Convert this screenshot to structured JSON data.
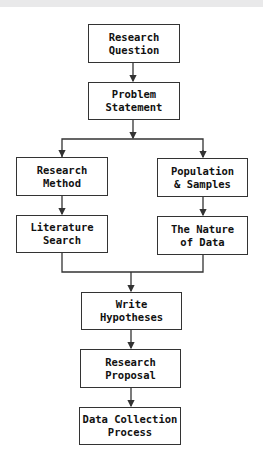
{
  "diagram": {
    "type": "flowchart",
    "nodes": {
      "research_question": {
        "line1": "Research",
        "line2": "Question"
      },
      "problem_statement": {
        "line1": "Problem",
        "line2": "Statement"
      },
      "research_method": {
        "line1": "Research",
        "line2": "Method"
      },
      "literature_search": {
        "line1": "Literature",
        "line2": "Search"
      },
      "population_samples": {
        "line1": "Population",
        "line2": "& Samples"
      },
      "nature_of_data": {
        "line1": "The Nature",
        "line2": "of Data"
      },
      "write_hypotheses": {
        "line1": "Write",
        "line2": "Hypotheses"
      },
      "research_proposal": {
        "line1": "Research",
        "line2": "Proposal"
      },
      "data_collection": {
        "line1": "Data Collection",
        "line2": "Process"
      }
    },
    "edges": [
      [
        "research_question",
        "problem_statement"
      ],
      [
        "problem_statement",
        "research_method"
      ],
      [
        "problem_statement",
        "population_samples"
      ],
      [
        "research_method",
        "literature_search"
      ],
      [
        "population_samples",
        "nature_of_data"
      ],
      [
        "literature_search",
        "write_hypotheses"
      ],
      [
        "nature_of_data",
        "write_hypotheses"
      ],
      [
        "write_hypotheses",
        "research_proposal"
      ],
      [
        "research_proposal",
        "data_collection"
      ]
    ],
    "colors": {
      "line": "#333333",
      "background": "#ffffff"
    }
  }
}
